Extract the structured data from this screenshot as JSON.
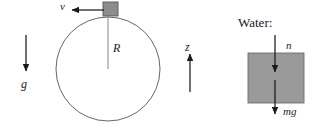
{
  "figure": {
    "title": "",
    "colors": {
      "stroke": "#1a1a1a",
      "circle_stroke": "#555555",
      "block_fill": "#8c8c8c",
      "block_stroke": "#555555",
      "water_fill": "#9a9a9a",
      "water_stroke": "#6e6e6e",
      "background": "#ffffff"
    }
  },
  "left_panel": {
    "name": "circular-loop-diagram",
    "gravity_label": "g",
    "velocity_label": "v",
    "radius_label": "R",
    "axis_label": "z",
    "circle": {
      "cx": 108,
      "cy": 69,
      "r": 52
    },
    "block": {
      "x": 103,
      "y": 2,
      "w": 15,
      "h": 14
    }
  },
  "right_panel": {
    "name": "water-block-free-body-diagram",
    "heading": "Water:",
    "normal_force_label": "n",
    "weight_label": "mg",
    "box": {
      "x": 248,
      "y": 53,
      "w": 56,
      "h": 50
    }
  }
}
